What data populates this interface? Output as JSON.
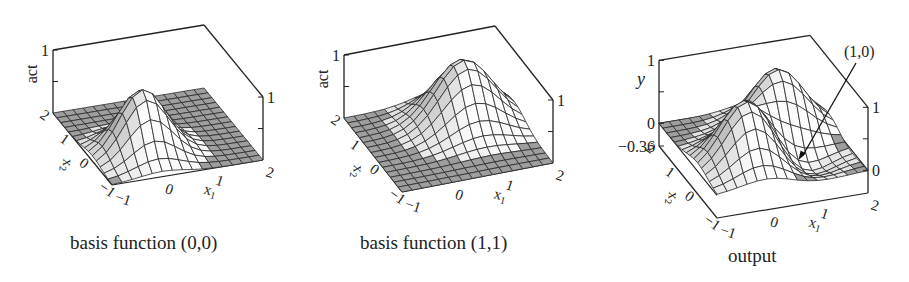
{
  "chart_data": [
    {
      "type": "surface",
      "title": "basis function (0,0)",
      "xlabel": "x1",
      "ylabel": "x2",
      "zlabel": "act",
      "x_ticks": [
        "-1",
        "0",
        "1",
        "2"
      ],
      "y_ticks": [
        "-1",
        "0",
        "1",
        "2"
      ],
      "z_ticks_left": [
        "1"
      ],
      "z_ticks_right": [
        "1"
      ],
      "xlim": [
        -1,
        2
      ],
      "ylim": [
        -1,
        2
      ],
      "zlim": [
        0,
        1
      ],
      "function": "gaussian",
      "center": [
        0,
        0
      ],
      "peak": 1,
      "grid": "15x15"
    },
    {
      "type": "surface",
      "title": "basis function (1,1)",
      "xlabel": "x1",
      "ylabel": "x2",
      "zlabel": "act",
      "x_ticks": [
        "-1",
        "0",
        "1",
        "2"
      ],
      "y_ticks": [
        "-1",
        "0",
        "1",
        "2"
      ],
      "z_ticks_left": [
        "1"
      ],
      "z_ticks_right": [
        "1"
      ],
      "xlim": [
        -1,
        2
      ],
      "ylim": [
        -1,
        2
      ],
      "zlim": [
        0,
        1
      ],
      "function": "gaussian",
      "center": [
        1,
        1
      ],
      "peak": 1,
      "grid": "15x15"
    },
    {
      "type": "surface",
      "title": "output",
      "xlabel": "x1",
      "ylabel": "x2",
      "zlabel": "y",
      "x_ticks": [
        "-1",
        "0",
        "1",
        "2"
      ],
      "y_ticks": [
        "-1",
        "0",
        "1",
        "2"
      ],
      "z_ticks_left": [
        "1",
        "0",
        "-0.36"
      ],
      "z_ticks_right": [
        "1",
        "0"
      ],
      "xlim": [
        -1,
        2
      ],
      "ylim": [
        -1,
        2
      ],
      "zlim": [
        -0.36,
        1
      ],
      "function": "weighted sum of gaussian basis functions",
      "annotation": "(1,0)",
      "components": [
        {
          "center": [
            0,
            0
          ],
          "weight": 1
        },
        {
          "center": [
            1,
            1
          ],
          "weight": 1
        },
        {
          "center": [
            1,
            0
          ],
          "weight": -0.36
        }
      ],
      "grid": "15x15"
    }
  ]
}
